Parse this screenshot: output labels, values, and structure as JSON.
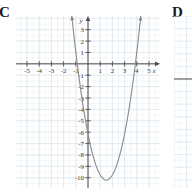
{
  "choices": {
    "c": {
      "letter": "C"
    },
    "d": {
      "letter": "D"
    }
  },
  "colors": {
    "grid_minor": "#e9eef2",
    "grid_major": "#dde6ec",
    "axis": "#4a4a4a",
    "curve": "#8a8a8a",
    "label_text": "#3d3d3d",
    "letter_text": "#1a1a1a",
    "background": "#ffffff"
  },
  "chart_data": {
    "type": "line",
    "title": "",
    "subtitle": "",
    "xlabel": "x",
    "ylabel": "y",
    "xlim": [
      -5.9,
      5.9
    ],
    "ylim": [
      -10.9,
      4.2
    ],
    "xticks": [
      -5,
      -4,
      -3,
      -2,
      -1,
      1,
      2,
      3,
      4,
      5
    ],
    "yticks": [
      -10,
      -9,
      -8,
      -7,
      -6,
      -5,
      -4,
      -3,
      -2,
      -1,
      1,
      2,
      3
    ],
    "xtick_labels": [
      "-5",
      "-4",
      "-3",
      "-2",
      "-1",
      "1",
      "2",
      "3",
      "4",
      "5"
    ],
    "ytick_labels": [
      "-10",
      "-9",
      "-8",
      "-7",
      "-6",
      "-5",
      "-4",
      "-3",
      "-2",
      "-1",
      "1",
      "2",
      "3"
    ],
    "grid": true,
    "legend": false,
    "annotations": [],
    "series": [
      {
        "name": "parabola",
        "kind": "quadratic",
        "equation": "y = 1.8(x - 1.5)^2 - 10.2",
        "vertex": [
          1.5,
          -10.2
        ],
        "x_intercepts": [
          -0.88,
          3.88
        ],
        "y_intercept": -6.15,
        "opens": "up",
        "arrow_ends": true,
        "x": [
          -1.55,
          -1.3,
          -1.0,
          -0.7,
          -0.4,
          -0.1,
          0.2,
          0.5,
          0.8,
          1.1,
          1.4,
          1.7,
          2.0,
          2.3,
          2.6,
          2.9,
          3.2,
          3.5,
          3.8,
          4.1,
          4.4,
          4.55
        ],
        "values": [
          4.0,
          1.88,
          -0.95,
          -3.26,
          -3.0,
          -5.4,
          -7.85,
          -8.4,
          -9.32,
          -9.92,
          -10.18,
          -10.13,
          -9.75,
          -9.05,
          -8.02,
          -6.67,
          -4.99,
          -3.0,
          -0.68,
          1.97,
          4.0,
          4.0
        ]
      }
    ]
  },
  "panel_d_chart": {
    "type": "line",
    "grid": true,
    "axis_visible": true,
    "cropped": true
  }
}
